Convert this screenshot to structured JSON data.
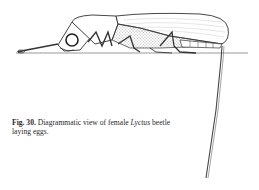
{
  "figure": {
    "caption": {
      "label": "Fig. 30.",
      "text_before": " Diagrammatic view of female ",
      "species": "Lyctus",
      "text_after": " beetle laying eggs."
    }
  },
  "colors": {
    "ink": "#2a2a2a",
    "background": "#ffffff"
  }
}
